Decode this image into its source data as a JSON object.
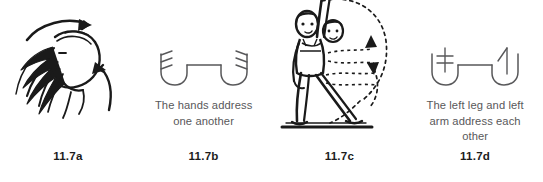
{
  "figure": {
    "title": "11.7",
    "panels": [
      {
        "label": "11.7a",
        "caption": "",
        "art": "head-tilted-back-sketch",
        "art_description": "Ink sketch of a head tipped back with long flowing hair, a curved arrow arcing over the crown and a second arrow curving upward from below"
      },
      {
        "label": "11.7b",
        "caption": "The hands address one another",
        "art": "two-hand-signs-addressing",
        "art_description": "Two Labanotation hand symbols joined by a horizontal address line"
      },
      {
        "label": "11.7c",
        "caption": "",
        "art": "dancer-arm-overhead-sketch",
        "art_description": "Ink sketch of a standing dancer with one arm raised overhead, dotted arrows tracing a circular path"
      },
      {
        "label": "11.7d",
        "caption": "The left leg and left arm address each other",
        "art": "leg-and-arm-signs-addressing",
        "art_description": "A left leg symbol and a left arm symbol joined by a horizontal address line"
      }
    ]
  },
  "colors": {
    "ink": "#1a1a1a",
    "sign": "#58585a",
    "caption_text": "#58585a",
    "label_text": "#1c1c1c",
    "background": "#ffffff"
  }
}
